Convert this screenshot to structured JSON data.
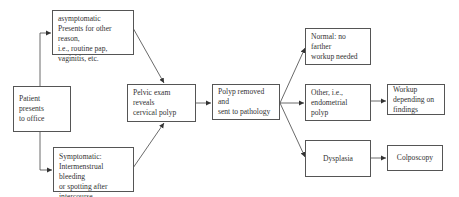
{
  "diagram": {
    "nodes": {
      "patient": {
        "label": "Patient presents\nto office"
      },
      "asymptomatic": {
        "label": "asymptomatic\nPresents for other reason,\ni.e., routine pap,\nvaginitis, etc."
      },
      "symptomatic": {
        "label": "Symptomatic:\nIntermenstrual bleeding\nor spotting after\nintercourse"
      },
      "pelvic_exam": {
        "label": "Pelvic exam reveals\ncervical polyp"
      },
      "polyp_removed": {
        "label": "Polyp removed and\nsent to pathology"
      },
      "normal": {
        "label": "Normal: no farther\nworkup needed"
      },
      "other": {
        "label": "Other, i.e.,\nendometrial polyp"
      },
      "workup": {
        "label": "Workup\ndepending on\nfindings"
      },
      "dysplasia": {
        "label": "Dysplasia"
      },
      "colposcopy": {
        "label": "Colposcopy"
      }
    },
    "edges": [
      {
        "from": "patient",
        "to": "asymptomatic"
      },
      {
        "from": "patient",
        "to": "symptomatic"
      },
      {
        "from": "asymptomatic",
        "to": "pelvic_exam"
      },
      {
        "from": "symptomatic",
        "to": "pelvic_exam"
      },
      {
        "from": "pelvic_exam",
        "to": "polyp_removed"
      },
      {
        "from": "polyp_removed",
        "to": "normal"
      },
      {
        "from": "polyp_removed",
        "to": "other"
      },
      {
        "from": "polyp_removed",
        "to": "dysplasia"
      },
      {
        "from": "other",
        "to": "workup"
      },
      {
        "from": "dysplasia",
        "to": "colposcopy"
      }
    ],
    "colors": {
      "line": "#444444",
      "border": "#555555",
      "text": "#333333",
      "background": "#ffffff"
    }
  }
}
